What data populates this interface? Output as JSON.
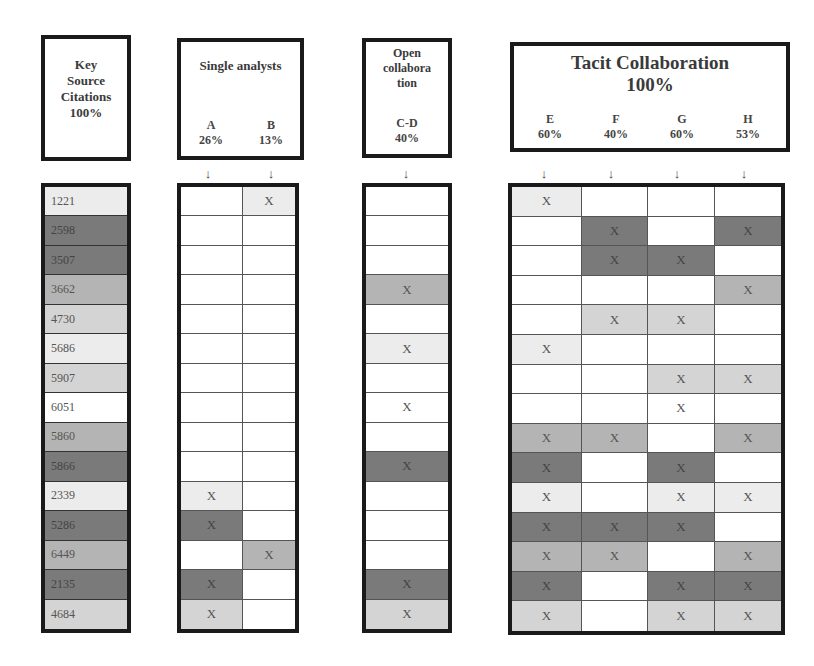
{
  "headers": {
    "key": {
      "lines": [
        "Key",
        "Source",
        "Citations",
        "100%"
      ]
    },
    "single": {
      "title": "Single analysts",
      "cols": [
        {
          "label": "A",
          "pct": "26%"
        },
        {
          "label": "B",
          "pct": "13%"
        }
      ]
    },
    "open": {
      "lines": [
        "Open",
        "collabora",
        "tion"
      ],
      "cols": [
        {
          "label": "C-D",
          "pct": "40%"
        }
      ]
    },
    "tacit": {
      "title": "Tacit Collaboration",
      "pct": "100%",
      "cols": [
        {
          "label": "E",
          "pct": "60%"
        },
        {
          "label": "F",
          "pct": "40%"
        },
        {
          "label": "G",
          "pct": "60%"
        },
        {
          "label": "H",
          "pct": "53%"
        }
      ]
    }
  },
  "arrow_glyph": "↓",
  "mark_glyph": "X",
  "shade_colors": {
    "0": "#ffffff",
    "1": "#ececec",
    "2": "#d4d4d4",
    "3": "#b4b4b4",
    "4": "#7a7a7a"
  },
  "rows": [
    {
      "citation": "1221",
      "shade": 1,
      "A": false,
      "B": true,
      "CD": false,
      "E": true,
      "F": false,
      "G": false,
      "H": false
    },
    {
      "citation": "2598",
      "shade": 4,
      "A": false,
      "B": false,
      "CD": false,
      "E": false,
      "F": true,
      "G": false,
      "H": true
    },
    {
      "citation": "3507",
      "shade": 4,
      "A": false,
      "B": false,
      "CD": false,
      "E": false,
      "F": true,
      "G": true,
      "H": false
    },
    {
      "citation": "3662",
      "shade": 3,
      "A": false,
      "B": false,
      "CD": true,
      "E": false,
      "F": false,
      "G": false,
      "H": true
    },
    {
      "citation": "4730",
      "shade": 2,
      "A": false,
      "B": false,
      "CD": false,
      "E": false,
      "F": true,
      "G": true,
      "H": false
    },
    {
      "citation": "5686",
      "shade": 1,
      "A": false,
      "B": false,
      "CD": true,
      "E": true,
      "F": false,
      "G": false,
      "H": false
    },
    {
      "citation": "5907",
      "shade": 2,
      "A": false,
      "B": false,
      "CD": false,
      "E": false,
      "F": false,
      "G": true,
      "H": true
    },
    {
      "citation": "6051",
      "shade": 0,
      "A": false,
      "B": false,
      "CD": true,
      "E": false,
      "F": false,
      "G": true,
      "H": false
    },
    {
      "citation": "5860",
      "shade": 3,
      "A": false,
      "B": false,
      "CD": false,
      "E": true,
      "F": true,
      "G": false,
      "H": true
    },
    {
      "citation": "5866",
      "shade": 4,
      "A": false,
      "B": false,
      "CD": true,
      "E": true,
      "F": false,
      "G": true,
      "H": false
    },
    {
      "citation": "2339",
      "shade": 1,
      "A": true,
      "B": false,
      "CD": false,
      "E": true,
      "F": false,
      "G": true,
      "H": true
    },
    {
      "citation": "5286",
      "shade": 4,
      "A": true,
      "B": false,
      "CD": false,
      "E": true,
      "F": true,
      "G": true,
      "H": false
    },
    {
      "citation": "6449",
      "shade": 3,
      "A": false,
      "B": true,
      "CD": false,
      "E": true,
      "F": true,
      "G": false,
      "H": true
    },
    {
      "citation": "2135",
      "shade": 4,
      "A": true,
      "B": false,
      "CD": true,
      "E": true,
      "F": false,
      "G": true,
      "H": true
    },
    {
      "citation": "4684",
      "shade": 2,
      "A": true,
      "B": false,
      "CD": true,
      "E": true,
      "F": false,
      "G": true,
      "H": true
    }
  ]
}
